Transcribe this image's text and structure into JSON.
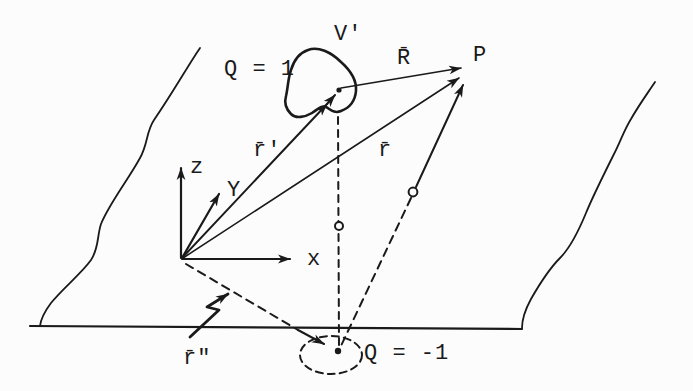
{
  "figure": {
    "ink_color": "#1a1a1a",
    "background_color": "#fcfcfc"
  },
  "labels": {
    "volume": "V'",
    "source_charge": "Q = 1",
    "vector_R": "R̄",
    "point_P": "P",
    "vector_r_prime": "r̄'",
    "vector_r": "r̄",
    "axis_z": "z",
    "axis_y": "Y",
    "axis_x": "x",
    "vector_r_double_prime": "r̄\"",
    "image_charge": "Q = -1"
  }
}
